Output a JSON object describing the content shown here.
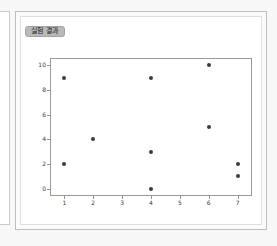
{
  "panel": {
    "title": "실험 결과"
  },
  "chart_data": {
    "type": "scatter",
    "title": "",
    "xlabel": "",
    "ylabel": "",
    "xlim": [
      0.5,
      7.5
    ],
    "ylim": [
      -0.6,
      10.6
    ],
    "grid": false,
    "legend": null,
    "xticks": [
      1,
      2,
      3,
      4,
      5,
      6,
      7
    ],
    "yticks": [
      0,
      2,
      4,
      6,
      8,
      10
    ],
    "xticklabels": [
      "1",
      "2",
      "3",
      "4",
      "5",
      "6",
      "7"
    ],
    "yticklabels": [
      "0",
      "2",
      "4",
      "6",
      "8",
      "10"
    ],
    "marker_color": "#3c3c3c",
    "x": [
      1,
      1,
      2,
      4,
      4,
      4,
      6,
      6,
      7,
      7
    ],
    "y": [
      9,
      2,
      4,
      9,
      3,
      0,
      10,
      5,
      2,
      1
    ],
    "points": [
      {
        "x": 1,
        "y": 9
      },
      {
        "x": 1,
        "y": 2
      },
      {
        "x": 2,
        "y": 4
      },
      {
        "x": 4,
        "y": 9
      },
      {
        "x": 4,
        "y": 3
      },
      {
        "x": 4,
        "y": 0
      },
      {
        "x": 6,
        "y": 10
      },
      {
        "x": 6,
        "y": 5
      },
      {
        "x": 7,
        "y": 2
      },
      {
        "x": 7,
        "y": 1
      }
    ]
  }
}
